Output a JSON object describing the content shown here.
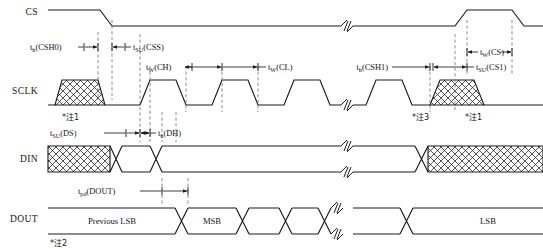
{
  "figure": {
    "type": "timing-diagram",
    "signals": [
      {
        "id": "cs",
        "name": "CS"
      },
      {
        "id": "sclk",
        "name": "SCLK"
      },
      {
        "id": "din",
        "name": "DIN"
      },
      {
        "id": "dout",
        "name": "DOUT"
      }
    ],
    "timing_params": [
      {
        "id": "th_csh0",
        "base": "t",
        "sub": "h",
        "arg": "(CSH0)",
        "signal": "cs"
      },
      {
        "id": "tsu_css",
        "base": "t",
        "sub": "SU",
        "arg": "(CSS)",
        "signal": "cs"
      },
      {
        "id": "tw_ch",
        "base": "t",
        "sub": "W",
        "arg": "(CH)",
        "signal": "sclk"
      },
      {
        "id": "tw_cl",
        "base": "t",
        "sub": "W",
        "arg": "(CL)",
        "signal": "sclk"
      },
      {
        "id": "th_csh1",
        "base": "t",
        "sub": "h",
        "arg": "(CSH1)",
        "signal": "cs"
      },
      {
        "id": "tw_cs",
        "base": "t",
        "sub": "W",
        "arg": "(CS)",
        "signal": "cs"
      },
      {
        "id": "tsu_cs1",
        "base": "t",
        "sub": "SU",
        "arg": "(CS1)",
        "signal": "cs"
      },
      {
        "id": "tsu_ds",
        "base": "t",
        "sub": "SU",
        "arg": "(DS)",
        "signal": "din"
      },
      {
        "id": "th_dh",
        "base": "t",
        "sub": "h",
        "arg": "(DH)",
        "signal": "din"
      },
      {
        "id": "tpd_dout",
        "base": "t",
        "sub": "pd",
        "arg": "(DOUT)",
        "signal": "dout"
      }
    ],
    "notes": [
      {
        "id": "note1a",
        "text": "*注1",
        "signal": "sclk",
        "position": "left"
      },
      {
        "id": "note3",
        "text": "*注3",
        "signal": "sclk",
        "position": "right"
      },
      {
        "id": "note1b",
        "text": "*注1",
        "signal": "sclk",
        "position": "right"
      },
      {
        "id": "note2",
        "text": "*注2",
        "signal": "dout",
        "position": "left"
      }
    ],
    "bus_values": [
      {
        "id": "dout-prev-lsb",
        "text": "Previous LSB",
        "signal": "dout"
      },
      {
        "id": "dout-msb",
        "text": "MSB",
        "signal": "dout"
      },
      {
        "id": "dout-lsb",
        "text": "LSB",
        "signal": "dout"
      }
    ],
    "colors": {
      "background": "#ffffff",
      "waveform": "#1c1c1c",
      "dashed_guide": "#6e6e6e",
      "text": "#141414"
    }
  }
}
